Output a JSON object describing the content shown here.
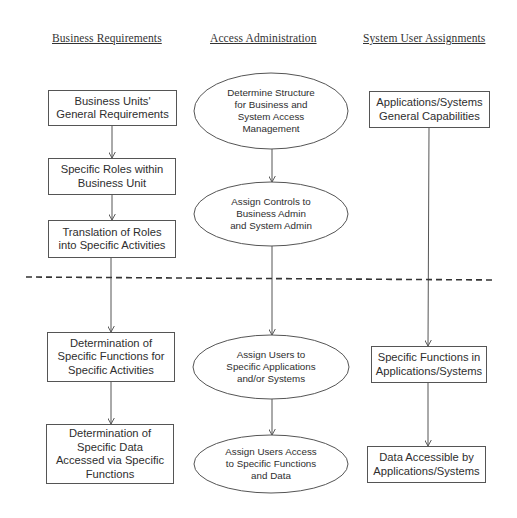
{
  "columns": [
    {
      "id": "business",
      "header": "Business Requirements"
    },
    {
      "id": "access",
      "header": "Access Administration"
    },
    {
      "id": "system",
      "header": "System User Assignments"
    }
  ],
  "nodes": {
    "business": [
      {
        "shape": "rect",
        "label": "Business Units'\nGeneral Requirements"
      },
      {
        "shape": "rect",
        "label": "Specific Roles within\nBusiness Unit"
      },
      {
        "shape": "rect",
        "label": "Translation of Roles\ninto Specific Activities"
      },
      {
        "shape": "rect",
        "label": "Determination of\nSpecific Functions for\nSpecific Activities"
      },
      {
        "shape": "rect",
        "label": "Determination of\nSpecific Data\nAccessed via Specific\nFunctions"
      }
    ],
    "access": [
      {
        "shape": "ellipse",
        "label": "Determine Structure\nfor Business and\nSystem Access\nManagement"
      },
      {
        "shape": "ellipse",
        "label": "Assign Controls to\nBusiness Admin\nand System Admin"
      },
      {
        "shape": "ellipse",
        "label": "Assign Users to\nSpecific Applications\nand/or Systems"
      },
      {
        "shape": "ellipse",
        "label": "Assign Users Access\nto Specific Functions\nand Data"
      }
    ],
    "system": [
      {
        "shape": "rect",
        "label": "Applications/Systems\nGeneral Capabilities"
      },
      {
        "shape": "rect",
        "label": "Specific Functions in\nApplications/Systems"
      },
      {
        "shape": "rect",
        "label": "Data Accessible by\nApplications/Systems"
      }
    ]
  },
  "divider": {
    "style": "dashed",
    "color": "#333333"
  },
  "colors": {
    "stroke": "#555555",
    "text": "#2e2e2e",
    "background": "#ffffff"
  }
}
